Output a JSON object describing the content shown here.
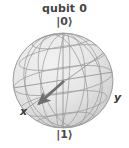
{
  "figure": {
    "title": "qubit 0",
    "type": "bloch-sphere",
    "labels": {
      "north_pole": "|0⟩",
      "south_pole": "|1⟩",
      "x_axis": "x",
      "y_axis": "y"
    },
    "colors": {
      "background": "#ffffff",
      "sphere_fill": "#e8e8e8",
      "wireframe": "#9a9a9a",
      "outline": "#a8a8a8",
      "arrow": "#6e6e6e",
      "text": "#444444"
    },
    "sphere": {
      "center_x": 63,
      "center_y": 80,
      "radius_x": 50,
      "radius_y": 47
    },
    "state_vector": {
      "tail_x": 64,
      "tail_y": 81,
      "tip_x": 36,
      "tip_y": 106,
      "direction": "down-left toward x axis"
    }
  }
}
